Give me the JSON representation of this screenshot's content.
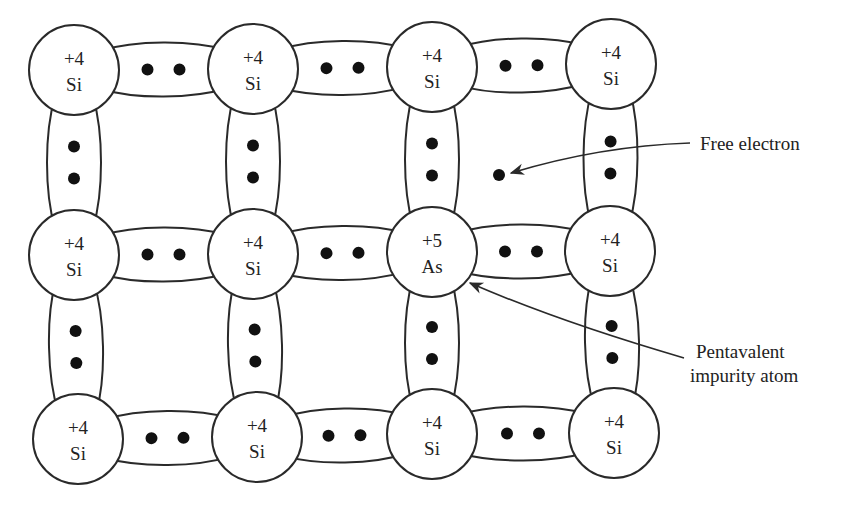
{
  "diagram": {
    "stroke_color": "#2a2a2a",
    "atoms": [
      {
        "charge": "+4",
        "symbol": "Si",
        "x": 74,
        "y": 70
      },
      {
        "charge": "+4",
        "symbol": "Si",
        "x": 253,
        "y": 69
      },
      {
        "charge": "+4",
        "symbol": "Si",
        "x": 432,
        "y": 67
      },
      {
        "charge": "+4",
        "symbol": "Si",
        "x": 611,
        "y": 64
      },
      {
        "charge": "+4",
        "symbol": "Si",
        "x": 74,
        "y": 255
      },
      {
        "charge": "+4",
        "symbol": "Si",
        "x": 253,
        "y": 254
      },
      {
        "charge": "+5",
        "symbol": "As",
        "x": 432,
        "y": 252
      },
      {
        "charge": "+4",
        "symbol": "Si",
        "x": 610,
        "y": 251
      },
      {
        "charge": "+4",
        "symbol": "Si",
        "x": 78,
        "y": 439
      },
      {
        "charge": "+4",
        "symbol": "Si",
        "x": 257,
        "y": 437
      },
      {
        "charge": "+4",
        "symbol": "Si",
        "x": 432,
        "y": 434
      },
      {
        "charge": "+4",
        "symbol": "Si",
        "x": 614,
        "y": 433
      }
    ],
    "free_electron": {
      "x": 499,
      "y": 175
    },
    "annotations": {
      "free_electron_label": "Free electron",
      "impurity_label_line1": "Pentavalent",
      "impurity_label_line2": "impurity atom"
    }
  }
}
